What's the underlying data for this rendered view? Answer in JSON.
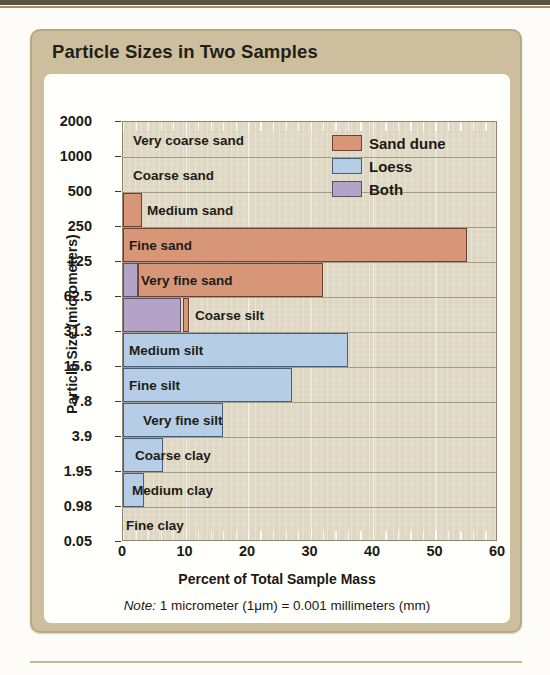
{
  "card": {
    "title": "Particle Sizes in Two Samples"
  },
  "note": {
    "prefix": "Note:",
    "text": " 1 micrometer (1μm) = 0.001 millimeters (mm)"
  },
  "legend": {
    "items": [
      {
        "label": "Sand dune",
        "key": "sand",
        "color": "#d79678"
      },
      {
        "label": "Loess",
        "key": "loess",
        "color": "#b6cde6"
      },
      {
        "label": "Both",
        "key": "both",
        "color": "#b3a3c6"
      }
    ]
  },
  "chart_data": {
    "type": "bar",
    "orientation": "horizontal",
    "title": "Particle Sizes in Two Samples",
    "xlabel": "Percent of Total Sample Mass",
    "ylabel": "Particle Size (micrometers)",
    "xlim": [
      0,
      60
    ],
    "xticks": [
      0,
      10,
      20,
      30,
      40,
      50,
      60
    ],
    "xtick_labels": [
      "0",
      "10",
      "20",
      "30",
      "40",
      "50",
      "60"
    ],
    "yscale": "category-boundaries",
    "ytick_labels": [
      "2000",
      "1000",
      "500",
      "250",
      "125",
      "62.5",
      "31.3",
      "15.6",
      "7.8",
      "3.9",
      "1.95",
      "0.98",
      "0.05"
    ],
    "grid": true,
    "legend_position": "top-right",
    "categories": [
      "Very coarse sand",
      "Coarse sand",
      "Medium sand",
      "Fine sand",
      "Very fine sand",
      "Coarse silt",
      "Medium silt",
      "Fine silt",
      "Very fine silt",
      "Coarse clay",
      "Medium clay",
      "Fine clay"
    ],
    "category_bounds_micrometers": [
      [
        "2000",
        "1000"
      ],
      [
        "1000",
        "500"
      ],
      [
        "500",
        "250"
      ],
      [
        "250",
        "125"
      ],
      [
        "125",
        "62.5"
      ],
      [
        "62.5",
        "31.3"
      ],
      [
        "31.3",
        "15.6"
      ],
      [
        "15.6",
        "7.8"
      ],
      [
        "7.8",
        "3.9"
      ],
      [
        "3.9",
        "1.95"
      ],
      [
        "1.95",
        "0.98"
      ],
      [
        "0.98",
        "0.05"
      ]
    ],
    "series": [
      {
        "name": "Sand dune",
        "key": "sand",
        "color": "#d79678",
        "values": [
          0,
          0,
          3,
          55,
          32,
          10.5,
          0,
          0,
          0,
          0,
          0,
          0
        ]
      },
      {
        "name": "Loess",
        "key": "loess",
        "color": "#b6cde6",
        "values": [
          0,
          0,
          0,
          0,
          0,
          0,
          36,
          27,
          16,
          6.4,
          3.4,
          0
        ]
      },
      {
        "name": "Both",
        "key": "both",
        "color": "#b3a3c6",
        "values": [
          0,
          0,
          0,
          0,
          2.4,
          9.3,
          0,
          0,
          0,
          0,
          0,
          0
        ]
      }
    ],
    "bars": [
      {
        "category": "Very coarse sand",
        "label_inset": 10,
        "segments": []
      },
      {
        "category": "Coarse sand",
        "label_inset": 10,
        "segments": []
      },
      {
        "category": "Medium sand",
        "label_inset": 24,
        "segments": [
          {
            "series": "sand",
            "start": 0,
            "end": 3
          }
        ]
      },
      {
        "category": "Fine sand",
        "label_inset": 6,
        "segments": [
          {
            "series": "sand",
            "start": 0,
            "end": 55
          }
        ]
      },
      {
        "category": "Very fine sand",
        "label_inset": 18,
        "segments": [
          {
            "series": "both",
            "start": 0,
            "end": 2.4
          },
          {
            "series": "sand",
            "start": 2.4,
            "end": 32
          }
        ]
      },
      {
        "category": "Coarse silt",
        "label_inset": 72,
        "segments": [
          {
            "series": "both",
            "start": 0,
            "end": 9.3
          },
          {
            "series": "sand",
            "start": 9.6,
            "end": 10.5
          }
        ]
      },
      {
        "category": "Medium silt",
        "label_inset": 6,
        "segments": [
          {
            "series": "loess",
            "start": 0,
            "end": 36
          }
        ]
      },
      {
        "category": "Fine silt",
        "label_inset": 6,
        "segments": [
          {
            "series": "loess",
            "start": 0,
            "end": 27
          }
        ]
      },
      {
        "category": "Very fine silt",
        "label_inset": 20,
        "segments": [
          {
            "series": "loess",
            "start": 0,
            "end": 16
          }
        ]
      },
      {
        "category": "Coarse clay",
        "label_inset": 12,
        "segments": [
          {
            "series": "loess",
            "start": 0,
            "end": 6.4
          }
        ]
      },
      {
        "category": "Medium clay",
        "label_inset": 9,
        "segments": [
          {
            "series": "loess",
            "start": 0,
            "end": 3.4
          }
        ]
      },
      {
        "category": "Fine clay",
        "label_inset": 3,
        "segments": []
      }
    ]
  }
}
